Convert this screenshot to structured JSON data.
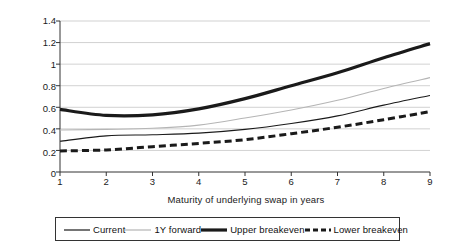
{
  "chart_data": {
    "type": "line",
    "title": "",
    "xlabel": "Maturity of underlying swap in years",
    "ylabel": "Rate in percent",
    "x": [
      1,
      2,
      3,
      4,
      5,
      6,
      7,
      8,
      9
    ],
    "xlim": [
      1,
      9
    ],
    "ylim": [
      0,
      1.4
    ],
    "ytick_labels": [
      "1.4",
      "1.2",
      "1",
      "0.8",
      "0.6",
      "0.4",
      "0.2",
      "0"
    ],
    "ytick_values": [
      1.4,
      1.2,
      1.0,
      0.8,
      0.6,
      0.4,
      0.2,
      0
    ],
    "xtick_labels": [
      "1",
      "2",
      "3",
      "4",
      "5",
      "6",
      "7",
      "8",
      "9"
    ],
    "grid": "horizontal",
    "legend_position": "bottom",
    "series": [
      {
        "name": "Current",
        "style": "thin-solid",
        "color": "#1a1a1a",
        "width": 1.1,
        "values": [
          0.285,
          0.335,
          0.345,
          0.36,
          0.395,
          0.45,
          0.52,
          0.62,
          0.71
        ]
      },
      {
        "name": "1Y forward",
        "style": "thin-solid-light",
        "color": "#b5b5b5",
        "width": 1.1,
        "values": [
          0.39,
          0.395,
          0.405,
          0.435,
          0.5,
          0.575,
          0.665,
          0.775,
          0.875
        ]
      },
      {
        "name": "Upper breakeven",
        "style": "thick-solid",
        "color": "#1a1a1a",
        "width": 3.2,
        "values": [
          0.58,
          0.525,
          0.53,
          0.585,
          0.68,
          0.8,
          0.92,
          1.06,
          1.19
        ]
      },
      {
        "name": "Lower breakeven",
        "style": "thick-dashed",
        "color": "#1a1a1a",
        "width": 3.0,
        "values": [
          0.195,
          0.205,
          0.235,
          0.265,
          0.3,
          0.355,
          0.415,
          0.485,
          0.56
        ]
      }
    ]
  },
  "legend": {
    "items": [
      {
        "label": "Current",
        "swatch": "thin-solid"
      },
      {
        "label": "1Y forward",
        "swatch": "thin-solid-light"
      },
      {
        "label": "Upper breakeven",
        "swatch": "thick-solid"
      },
      {
        "label": "Lower breakeven",
        "swatch": "thick-dashed"
      }
    ]
  }
}
